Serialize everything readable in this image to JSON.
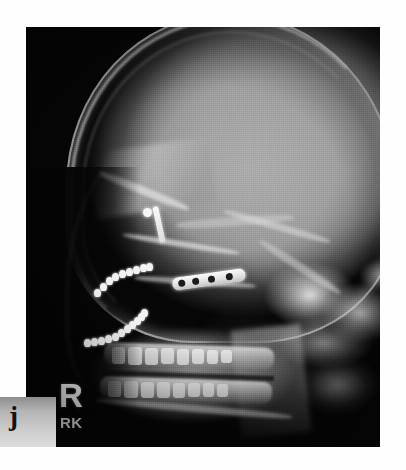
{
  "image": {
    "kind": "radiograph",
    "modality": "X-ray",
    "view": "lateral cephalometric",
    "subject": "human skull, lateral profile",
    "background_color": "#ffffff",
    "film_background_color": "#060606",
    "bone_color": "#b0b0b0",
    "hardware_color": "#f5f5f5"
  },
  "markers": {
    "side_marker": "R",
    "technologist_initials": "RK",
    "figure_letter": "j"
  },
  "hardware": {
    "bone_plate": {
      "name": "bone-plate",
      "hole_count": 4,
      "hole_offsets": [
        6,
        20,
        36,
        54
      ]
    },
    "screw": {
      "name": "cortical-screw",
      "parts": [
        "head",
        "shaft"
      ]
    },
    "wire_chains": [
      {
        "name": "wire-chain-upper",
        "bead_count": 9,
        "beads": [
          {
            "x": 0,
            "y": 26
          },
          {
            "x": 6,
            "y": 20
          },
          {
            "x": 12,
            "y": 14
          },
          {
            "x": 18,
            "y": 10
          },
          {
            "x": 25,
            "y": 7
          },
          {
            "x": 32,
            "y": 5
          },
          {
            "x": 39,
            "y": 3
          },
          {
            "x": 46,
            "y": 1
          },
          {
            "x": 52,
            "y": 0
          }
        ]
      },
      {
        "name": "wire-chain-lower",
        "bead_count": 11,
        "beads": [
          {
            "x": 0,
            "y": 30
          },
          {
            "x": 7,
            "y": 29
          },
          {
            "x": 14,
            "y": 28
          },
          {
            "x": 21,
            "y": 26
          },
          {
            "x": 28,
            "y": 24
          },
          {
            "x": 34,
            "y": 20
          },
          {
            "x": 40,
            "y": 16
          },
          {
            "x": 45,
            "y": 12
          },
          {
            "x": 50,
            "y": 8
          },
          {
            "x": 54,
            "y": 4
          },
          {
            "x": 57,
            "y": 0
          }
        ]
      }
    ]
  },
  "teeth": {
    "maxillary": [
      {
        "x": 6,
        "y": 0,
        "w": 13,
        "h": 17
      },
      {
        "x": 22,
        "y": 0,
        "w": 14,
        "h": 18
      },
      {
        "x": 39,
        "y": 1,
        "w": 13,
        "h": 17
      },
      {
        "x": 55,
        "y": 1,
        "w": 13,
        "h": 16
      },
      {
        "x": 71,
        "y": 2,
        "w": 12,
        "h": 16
      },
      {
        "x": 86,
        "y": 2,
        "w": 12,
        "h": 15
      },
      {
        "x": 101,
        "y": 3,
        "w": 11,
        "h": 14
      },
      {
        "x": 115,
        "y": 3,
        "w": 11,
        "h": 13
      }
    ],
    "mandibular": [
      {
        "x": 4,
        "y": 0,
        "w": 13,
        "h": 16
      },
      {
        "x": 20,
        "y": 0,
        "w": 14,
        "h": 17
      },
      {
        "x": 37,
        "y": 1,
        "w": 13,
        "h": 16
      },
      {
        "x": 53,
        "y": 1,
        "w": 13,
        "h": 16
      },
      {
        "x": 69,
        "y": 2,
        "w": 12,
        "h": 15
      },
      {
        "x": 84,
        "y": 2,
        "w": 12,
        "h": 14
      },
      {
        "x": 99,
        "y": 2,
        "w": 11,
        "h": 14
      },
      {
        "x": 113,
        "y": 3,
        "w": 11,
        "h": 13
      }
    ]
  }
}
